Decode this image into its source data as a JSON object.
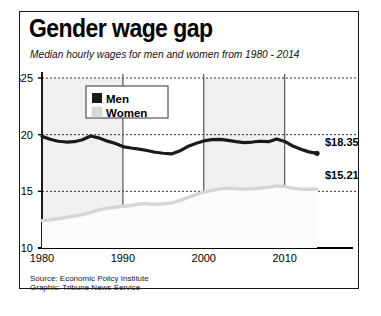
{
  "chart_data": {
    "type": "line",
    "title": "Gender wage gap",
    "subtitle": "Median hourly wages for men and women from 1980 - 2014",
    "xlabel": "",
    "ylabel": "",
    "xlim": [
      1980,
      2014
    ],
    "ylim": [
      10,
      25
    ],
    "grid": true,
    "legend_position": "top-left-inside",
    "ytick_labels": [
      "$25",
      "20",
      "15",
      "10"
    ],
    "ytick_values": [
      25,
      20,
      15,
      10
    ],
    "xtick_labels": [
      "1980",
      "1990",
      "2000",
      "2010"
    ],
    "xtick_values": [
      1980,
      1990,
      2000,
      2010
    ],
    "shaded_bands": [
      [
        1980,
        1990
      ],
      [
        2000,
        2010
      ]
    ],
    "x": [
      1980,
      1981,
      1982,
      1983,
      1984,
      1985,
      1986,
      1987,
      1988,
      1989,
      1990,
      1991,
      1992,
      1993,
      1994,
      1995,
      1996,
      1997,
      1998,
      1999,
      2000,
      2001,
      2002,
      2003,
      2004,
      2005,
      2006,
      2007,
      2008,
      2009,
      2010,
      2011,
      2012,
      2013,
      2014
    ],
    "series": [
      {
        "name": "Men",
        "color": "#1a1a1a",
        "end_label": "$18.35",
        "end_value": 18.35,
        "values": [
          19.85,
          19.6,
          19.42,
          19.35,
          19.38,
          19.55,
          19.88,
          19.72,
          19.45,
          19.25,
          18.95,
          18.82,
          18.72,
          18.6,
          18.45,
          18.36,
          18.3,
          18.55,
          18.95,
          19.22,
          19.45,
          19.56,
          19.58,
          19.5,
          19.38,
          19.3,
          19.35,
          19.42,
          19.38,
          19.62,
          19.4,
          19.0,
          18.72,
          18.48,
          18.35
        ]
      },
      {
        "name": "Women",
        "color": "#d5d5d5",
        "end_label": "$15.21",
        "end_value": 15.21,
        "values": [
          12.42,
          12.48,
          12.58,
          12.7,
          12.82,
          12.95,
          13.15,
          13.35,
          13.5,
          13.6,
          13.68,
          13.75,
          13.88,
          13.92,
          13.85,
          13.9,
          13.98,
          14.18,
          14.45,
          14.7,
          14.92,
          15.08,
          15.22,
          15.28,
          15.25,
          15.2,
          15.22,
          15.28,
          15.35,
          15.48,
          15.42,
          15.28,
          15.2,
          15.18,
          15.21
        ]
      }
    ]
  },
  "legend": {
    "items": [
      {
        "label": "Men",
        "color": "#1a1a1a"
      },
      {
        "label": "Women",
        "color": "#d8d8d8"
      }
    ]
  },
  "footer": {
    "source": "Source: Economic Policy Institute",
    "graphic": "Graphic: Tribune News Service"
  }
}
